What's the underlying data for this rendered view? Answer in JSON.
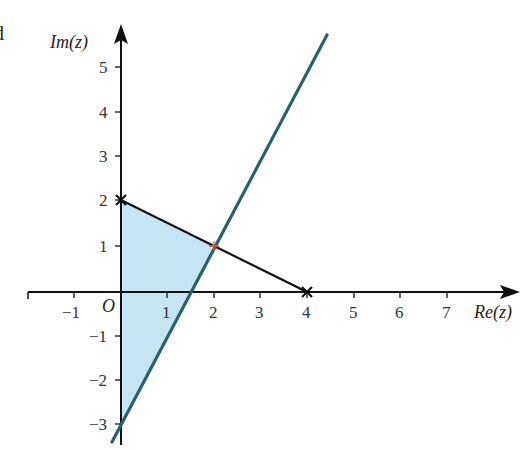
{
  "figure": {
    "corner_label": "d",
    "x_axis_label": "Re(z)",
    "y_axis_label": "Im(z)",
    "origin_label": "O",
    "x_ticks": [
      {
        "label": "−1",
        "value": -1
      },
      {
        "label": "1",
        "value": 1
      },
      {
        "label": "2",
        "value": 2
      },
      {
        "label": "3",
        "value": 3
      },
      {
        "label": "4",
        "value": 4
      },
      {
        "label": "5",
        "value": 5
      },
      {
        "label": "6",
        "value": 6
      },
      {
        "label": "7",
        "value": 7
      }
    ],
    "y_ticks": [
      {
        "label": "5",
        "value": 5
      },
      {
        "label": "4",
        "value": 4
      },
      {
        "label": "3",
        "value": 3
      },
      {
        "label": "2",
        "value": 2
      },
      {
        "label": "1",
        "value": 1
      },
      {
        "label": "−1",
        "value": -1
      },
      {
        "label": "−2",
        "value": -2
      },
      {
        "label": "−3",
        "value": -3
      }
    ],
    "colors": {
      "axis": "#111111",
      "segment": "#111111",
      "line": "#2a5f6e",
      "shaded_region": "#bfe2f4",
      "intersection_marker": "#e0553a"
    },
    "elements": {
      "segment": {
        "from": [
          0,
          2
        ],
        "to": [
          4,
          0
        ],
        "description": "segment joining points marked with crosses"
      },
      "line": {
        "equation": "y = 2x - 3",
        "description": "straight line through (1.5, 0) and (0, -3)"
      },
      "intersection": {
        "point": [
          2,
          1
        ]
      },
      "shaded_region": {
        "vertices": [
          [
            0,
            2
          ],
          [
            2,
            1
          ],
          [
            0,
            -3
          ]
        ]
      },
      "cross_markers": [
        [
          0,
          2
        ],
        [
          4,
          0
        ]
      ]
    }
  }
}
